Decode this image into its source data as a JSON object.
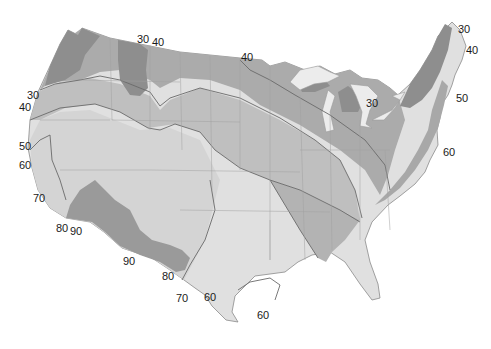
{
  "map": {
    "type": "isoline-map",
    "region": "Contiguous United States",
    "shading": {
      "darkest": "#8c8c8c",
      "dark": "#a6a6a6",
      "mid": "#bdbdbd",
      "light": "#d2d2d2",
      "lightest": "#e2e2e2",
      "water": "#ececec",
      "line": "#6e6e6e",
      "border": "#9a9a9a"
    },
    "contour_values": [
      30,
      40,
      50,
      60,
      70,
      80,
      90
    ],
    "labels": [
      {
        "text": "30",
        "x": 137,
        "y": 40
      },
      {
        "text": "40",
        "x": 152,
        "y": 43
      },
      {
        "text": "40",
        "x": 241,
        "y": 54
      },
      {
        "text": "30",
        "x": 458,
        "y": 26
      },
      {
        "text": "40",
        "x": 466,
        "y": 47
      },
      {
        "text": "30",
        "x": 366,
        "y": 98
      },
      {
        "text": "50",
        "x": 456,
        "y": 95
      },
      {
        "text": "60",
        "x": 443,
        "y": 148
      },
      {
        "text": "30",
        "x": 27,
        "y": 90
      },
      {
        "text": "40",
        "x": 19,
        "y": 103
      },
      {
        "text": "50",
        "x": 19,
        "y": 141
      },
      {
        "text": "60",
        "x": 19,
        "y": 160
      },
      {
        "text": "70",
        "x": 33,
        "y": 194
      },
      {
        "text": "80",
        "x": 56,
        "y": 224
      },
      {
        "text": "90",
        "x": 70,
        "y": 226
      },
      {
        "text": "90",
        "x": 123,
        "y": 256
      },
      {
        "text": "80",
        "x": 162,
        "y": 272
      },
      {
        "text": "70",
        "x": 176,
        "y": 293
      },
      {
        "text": "60",
        "x": 204,
        "y": 292
      },
      {
        "text": "60",
        "x": 257,
        "y": 310
      }
    ]
  }
}
